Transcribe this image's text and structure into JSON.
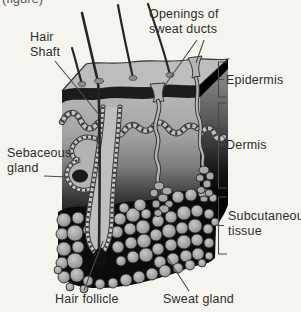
{
  "caption_fragment": "(figure)",
  "labels": {
    "hair_shaft": {
      "line1": "Hair",
      "line2": "Shaft"
    },
    "sweat_duct_openings": {
      "line1": "Openings of",
      "line2": "sweat ducts"
    },
    "epidermis": "Epidermis",
    "dermis": "Dermis",
    "subcutaneous": {
      "line1": "Subcutaneous",
      "line2": "tissue"
    },
    "sebaceous_gland": {
      "line1": "Sebaceous",
      "line2": "gland"
    },
    "hair_follicle": "Hair follicle",
    "sweat_gland": "Sweat gland"
  },
  "colors": {
    "background": "#f5f4ee",
    "text": "#2d2d2d",
    "pointer_line": "#4a4a4a",
    "epidermis_band": "#1c1c1c",
    "top_face": "#bdbdbd",
    "fat_lobule": "#a0a0a0",
    "subcutaneous_background": "#0b0b0b"
  }
}
